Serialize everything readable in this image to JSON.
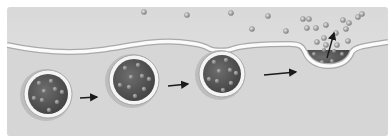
{
  "diagram": {
    "title": "",
    "type": "exocytosis-sequence",
    "colors": {
      "page": "#ffffff",
      "extracellular": "#e2e2e2",
      "cytoplasm": "#d6d6d6",
      "membrane_fill": "#fbfbfb",
      "membrane_edge": "#a9a9a9",
      "vesicle_core": "#4a4a4a",
      "vesicle_core_light": "#6e6e6e",
      "vesicle_ring": "#f4f4f4",
      "vesicle_halo": "#bdbdbd",
      "particle": "#9a9a9a",
      "particle_hi": "#e4e4e4",
      "arrow": "#1a1a1a"
    },
    "panel": {
      "x": 7,
      "y": 7,
      "w": 381,
      "h": 129
    },
    "membrane_path": "M7 45 C 40 52, 70 54, 100 50 C 130 46, 150 40, 180 42 C 200 44, 205 46, 210 49 C 214 51, 228 51, 232 49 C 240 46, 260 44, 290 44 C 300 44, 303 47, 305 52 C 308 60, 316 66, 328 66 C 342 66, 349 60, 352 52 C 355 47, 362 46, 388 42",
    "vesicles": [
      {
        "id": "vesicle-1",
        "cx": 48,
        "cy": 94,
        "r": 24,
        "stage": "approaching"
      },
      {
        "id": "vesicle-2",
        "cx": 134,
        "cy": 80,
        "r": 25,
        "stage": "docking"
      },
      {
        "id": "vesicle-3",
        "cx": 222,
        "cy": 74,
        "r": 23,
        "stage": "fusing"
      }
    ],
    "fused_pocket": {
      "cx": 328,
      "cy": 52,
      "rx": 24,
      "ry": 18,
      "stage": "releasing"
    },
    "vesicle_particles": [
      [
        [
          -9,
          -11
        ],
        [
          3,
          -13
        ],
        [
          -4,
          -3
        ],
        [
          7,
          -5
        ],
        [
          14,
          -2
        ],
        [
          -14,
          4
        ],
        [
          -6,
          6
        ],
        [
          9,
          8
        ],
        [
          1,
          16
        ]
      ],
      [
        [
          -9,
          -12
        ],
        [
          4,
          -15
        ],
        [
          -3,
          -3
        ],
        [
          8,
          -4
        ],
        [
          15,
          -1
        ],
        [
          -14,
          5
        ],
        [
          -5,
          7
        ],
        [
          10,
          9
        ],
        [
          1,
          16
        ]
      ],
      [
        [
          -8,
          -12
        ],
        [
          4,
          -14
        ],
        [
          -3,
          -3
        ],
        [
          8,
          -4
        ],
        [
          14,
          -1
        ],
        [
          -13,
          5
        ],
        [
          -5,
          7
        ],
        [
          9,
          9
        ],
        [
          1,
          16
        ]
      ]
    ],
    "pocket_particles": [
      [
        -14,
        2
      ],
      [
        -4,
        -2
      ],
      [
        6,
        -1
      ],
      [
        14,
        2
      ],
      [
        -6,
        10
      ],
      [
        4,
        9
      ]
    ],
    "released_particles": [
      [
        144,
        12
      ],
      [
        187,
        15
      ],
      [
        231,
        13
      ],
      [
        252,
        29
      ],
      [
        268,
        16
      ],
      [
        286,
        31
      ],
      [
        303,
        19
      ],
      [
        309,
        19
      ],
      [
        307,
        28
      ],
      [
        316,
        28
      ],
      [
        326,
        25
      ],
      [
        343,
        20
      ],
      [
        349,
        23
      ],
      [
        358,
        17
      ],
      [
        362,
        14
      ],
      [
        346,
        29
      ],
      [
        317,
        42
      ],
      [
        324,
        38
      ],
      [
        336,
        33
      ],
      [
        348,
        41
      ],
      [
        337,
        45
      ],
      [
        326,
        45
      ]
    ],
    "arrows": [
      {
        "id": "arrow-1",
        "x1": 80,
        "y1": 98,
        "x2": 97,
        "y2": 97
      },
      {
        "id": "arrow-2",
        "x1": 168,
        "y1": 86,
        "x2": 188,
        "y2": 84
      },
      {
        "id": "arrow-3",
        "x1": 264,
        "y1": 75,
        "x2": 296,
        "y2": 72
      },
      {
        "id": "release-arrow",
        "x1": 327,
        "y1": 58,
        "x2": 334,
        "y2": 33
      }
    ]
  }
}
